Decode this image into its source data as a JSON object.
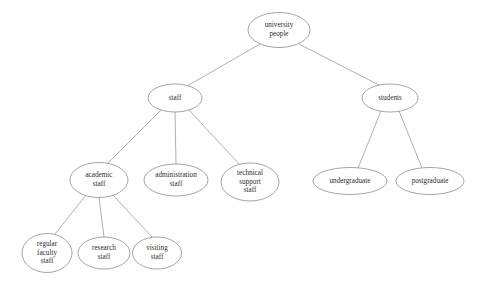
{
  "diagram": {
    "type": "tree",
    "background_color": "#ffffff",
    "node_stroke_color": "#8d8d8d",
    "edge_stroke_color": "#9a9a9a",
    "text_color": "#2b2b2b",
    "nodes": [
      {
        "id": "university-people",
        "lines": [
          "university",
          "people"
        ],
        "cx": 279,
        "cy": 30,
        "rx": 31,
        "ry": 17.5,
        "level": 0
      },
      {
        "id": "staff",
        "lines": [
          "staff"
        ],
        "cx": 175,
        "cy": 98,
        "rx": 27,
        "ry": 14,
        "level": 1
      },
      {
        "id": "students",
        "lines": [
          "students"
        ],
        "cx": 390,
        "cy": 98,
        "rx": 28,
        "ry": 14,
        "level": 1
      },
      {
        "id": "academic-staff",
        "lines": [
          "academic",
          "staff"
        ],
        "cx": 99,
        "cy": 180,
        "rx": 29,
        "ry": 17.5,
        "level": 2
      },
      {
        "id": "administration-staff",
        "lines": [
          "administration",
          "staff"
        ],
        "cx": 176,
        "cy": 180,
        "rx": 32,
        "ry": 16,
        "level": 2
      },
      {
        "id": "technical-support-staff",
        "lines": [
          "technical",
          "support",
          "staff"
        ],
        "cx": 250,
        "cy": 182,
        "rx": 29,
        "ry": 19,
        "level": 2
      },
      {
        "id": "undergraduate",
        "lines": [
          "undergraduate"
        ],
        "cx": 350,
        "cy": 181,
        "rx": 37,
        "ry": 13.5,
        "level": 2
      },
      {
        "id": "postgraduate",
        "lines": [
          "postgraduate"
        ],
        "cx": 430,
        "cy": 181,
        "rx": 34,
        "ry": 13.5,
        "level": 2
      },
      {
        "id": "regular-faculty-staff",
        "lines": [
          "regular",
          "faculty",
          "staff"
        ],
        "cx": 47,
        "cy": 253,
        "rx": 25,
        "ry": 19.5,
        "level": 3
      },
      {
        "id": "research-staff",
        "lines": [
          "research",
          "staff"
        ],
        "cx": 104,
        "cy": 253,
        "rx": 26,
        "ry": 16,
        "level": 3
      },
      {
        "id": "visiting-staff",
        "lines": [
          "visiting",
          "staff"
        ],
        "cx": 157,
        "cy": 253,
        "rx": 24.5,
        "ry": 16,
        "level": 3
      }
    ],
    "edges": [
      {
        "id": "edge-root-staff",
        "from": "university-people",
        "to": "staff",
        "x1": 260,
        "y1": 44,
        "x2": 187,
        "y2": 86
      },
      {
        "id": "edge-root-students",
        "from": "university-people",
        "to": "students",
        "x1": 299,
        "y1": 44,
        "x2": 379,
        "y2": 85
      },
      {
        "id": "edge-staff-academic",
        "from": "staff",
        "to": "academic-staff",
        "x1": 161,
        "y1": 110,
        "x2": 108,
        "y2": 163
      },
      {
        "id": "edge-staff-administration",
        "from": "staff",
        "to": "administration-staff",
        "x1": 175,
        "y1": 112,
        "x2": 176,
        "y2": 164
      },
      {
        "id": "edge-staff-technical",
        "from": "staff",
        "to": "technical-support-staff",
        "x1": 189,
        "y1": 110,
        "x2": 240,
        "y2": 165
      },
      {
        "id": "edge-students-undergraduate",
        "from": "students",
        "to": "undergraduate",
        "x1": 381,
        "y1": 111,
        "x2": 358,
        "y2": 168
      },
      {
        "id": "edge-students-postgraduate",
        "from": "students",
        "to": "postgraduate",
        "x1": 399,
        "y1": 111,
        "x2": 422,
        "y2": 168
      },
      {
        "id": "edge-academic-regular",
        "from": "academic-staff",
        "to": "regular-faculty-staff",
        "x1": 86,
        "y1": 195,
        "x2": 55,
        "y2": 234
      },
      {
        "id": "edge-academic-research",
        "from": "academic-staff",
        "to": "research-staff",
        "x1": 99,
        "y1": 197,
        "x2": 104,
        "y2": 237
      },
      {
        "id": "edge-academic-visiting",
        "from": "academic-staff",
        "to": "visiting-staff",
        "x1": 113,
        "y1": 195,
        "x2": 152,
        "y2": 237
      }
    ]
  }
}
